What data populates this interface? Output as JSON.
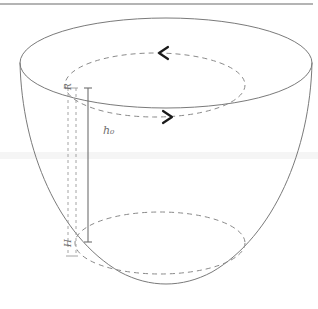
{
  "figure": {
    "kind": "3d-bowl-diagram",
    "labels": {
      "height_label": "h₀",
      "radius_label": "R",
      "depth_label": "H"
    },
    "colors": {
      "outline": "#7a7a7a",
      "dashed": "#8a8a8a",
      "arrow": "#1a1a1a",
      "measure_line": "#6f6f6f",
      "guide_dash": "#9a9a9a",
      "label_text": "#6f6f6f",
      "top_rule": "#9b9b9b",
      "band": "#f4f4f4",
      "background": "#ffffff"
    },
    "geometry": {
      "top_rim": {
        "cx": 166,
        "cy": 63,
        "rx": 146,
        "ry": 45
      },
      "inner_circulation_ellipse": {
        "cx": 155,
        "cy": 85,
        "rx": 90,
        "ry": 32
      },
      "fluid_surface_ellipse": {
        "cx": 160,
        "cy": 243,
        "rx": 85,
        "ry": 31
      },
      "measure_line": {
        "x": 88,
        "y_top": 88,
        "y_bottom": 242
      },
      "guide_dash_left": {
        "x": 68,
        "y_top": 88,
        "y_bottom": 254
      },
      "guide_dash_right": {
        "x": 76,
        "y_top": 88,
        "y_bottom": 254
      }
    },
    "arrows": [
      {
        "name": "circulation-arrow-top",
        "direction": "left",
        "x": 163,
        "y": 51
      },
      {
        "name": "circulation-arrow-bottom",
        "direction": "right",
        "x": 168,
        "y": 118
      }
    ],
    "rules": [
      {
        "name": "top-horizontal-rule",
        "y": 4,
        "x1": 0,
        "x2": 313
      }
    ]
  }
}
